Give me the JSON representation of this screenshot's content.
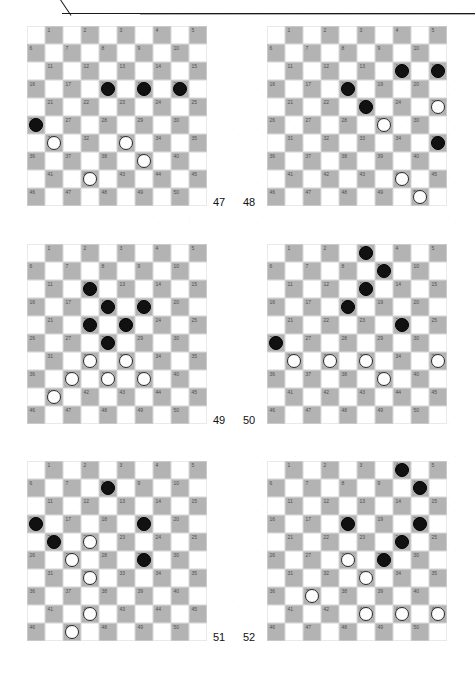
{
  "page": {
    "header_text": "",
    "board_size": 10,
    "squares_total": 50,
    "piece_colors": {
      "black": "#111111",
      "white": "#fdfdfd",
      "dark_square": "#b3b3b3",
      "light_square": "#ffffff"
    }
  },
  "diagrams": [
    {
      "label": "47",
      "label_side": "right",
      "black": [
        18,
        19,
        20,
        26
      ],
      "white": [
        31,
        33,
        39,
        42
      ]
    },
    {
      "label": "48",
      "label_side": "left",
      "black": [
        14,
        15,
        18,
        23,
        35
      ],
      "white": [
        25,
        29,
        44,
        50
      ]
    },
    {
      "label": "49",
      "label_side": "right",
      "black": [
        12,
        18,
        19,
        22,
        23,
        28
      ],
      "white": [
        32,
        33,
        37,
        38,
        39,
        41
      ]
    },
    {
      "label": "50",
      "label_side": "left",
      "black": [
        3,
        9,
        13,
        18,
        24,
        26
      ],
      "white": [
        31,
        32,
        33,
        35,
        39
      ]
    },
    {
      "label": "51",
      "label_side": "right",
      "black": [
        8,
        16,
        19,
        21,
        29
      ],
      "white": [
        22,
        27,
        32,
        42,
        47
      ]
    },
    {
      "label": "52",
      "label_side": "left",
      "black": [
        4,
        10,
        18,
        20,
        24,
        29
      ],
      "white": [
        28,
        33,
        37,
        43,
        44,
        45
      ]
    }
  ],
  "layout": {
    "positions": [
      {
        "x": 27,
        "y": 8,
        "label_x": 213,
        "label_y": 178
      },
      {
        "x": 267,
        "y": 8,
        "label_x": 243,
        "label_y": 178
      },
      {
        "x": 27,
        "y": 226,
        "label_x": 213,
        "label_y": 396
      },
      {
        "x": 267,
        "y": 226,
        "label_x": 243,
        "label_y": 396
      },
      {
        "x": 27,
        "y": 443,
        "label_x": 213,
        "label_y": 613
      },
      {
        "x": 267,
        "y": 443,
        "label_x": 243,
        "label_y": 613
      }
    ]
  }
}
